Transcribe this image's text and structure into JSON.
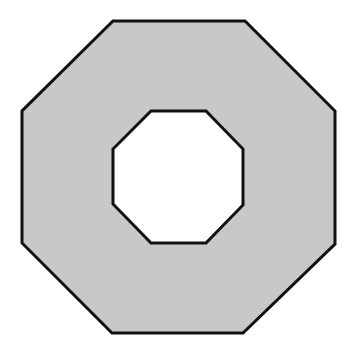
{
  "diagram": {
    "type": "octagonal-ring",
    "background_color": "#ffffff",
    "fill_color": "#c8c8c8",
    "stroke_color": "#111111",
    "stroke_width": 3,
    "hole_color": "#ffffff",
    "outer_octagon": {
      "points": [
        [
          113,
          21
        ],
        [
          245,
          21
        ],
        [
          335,
          111
        ],
        [
          335,
          244
        ],
        [
          243,
          333
        ],
        [
          112,
          333
        ],
        [
          22,
          243
        ],
        [
          22,
          111
        ]
      ]
    },
    "inner_octagon": {
      "points": [
        [
          151,
          111
        ],
        [
          206,
          111
        ],
        [
          243,
          149
        ],
        [
          243,
          205
        ],
        [
          206,
          243
        ],
        [
          151,
          243
        ],
        [
          113,
          204
        ],
        [
          113,
          149
        ]
      ]
    }
  }
}
